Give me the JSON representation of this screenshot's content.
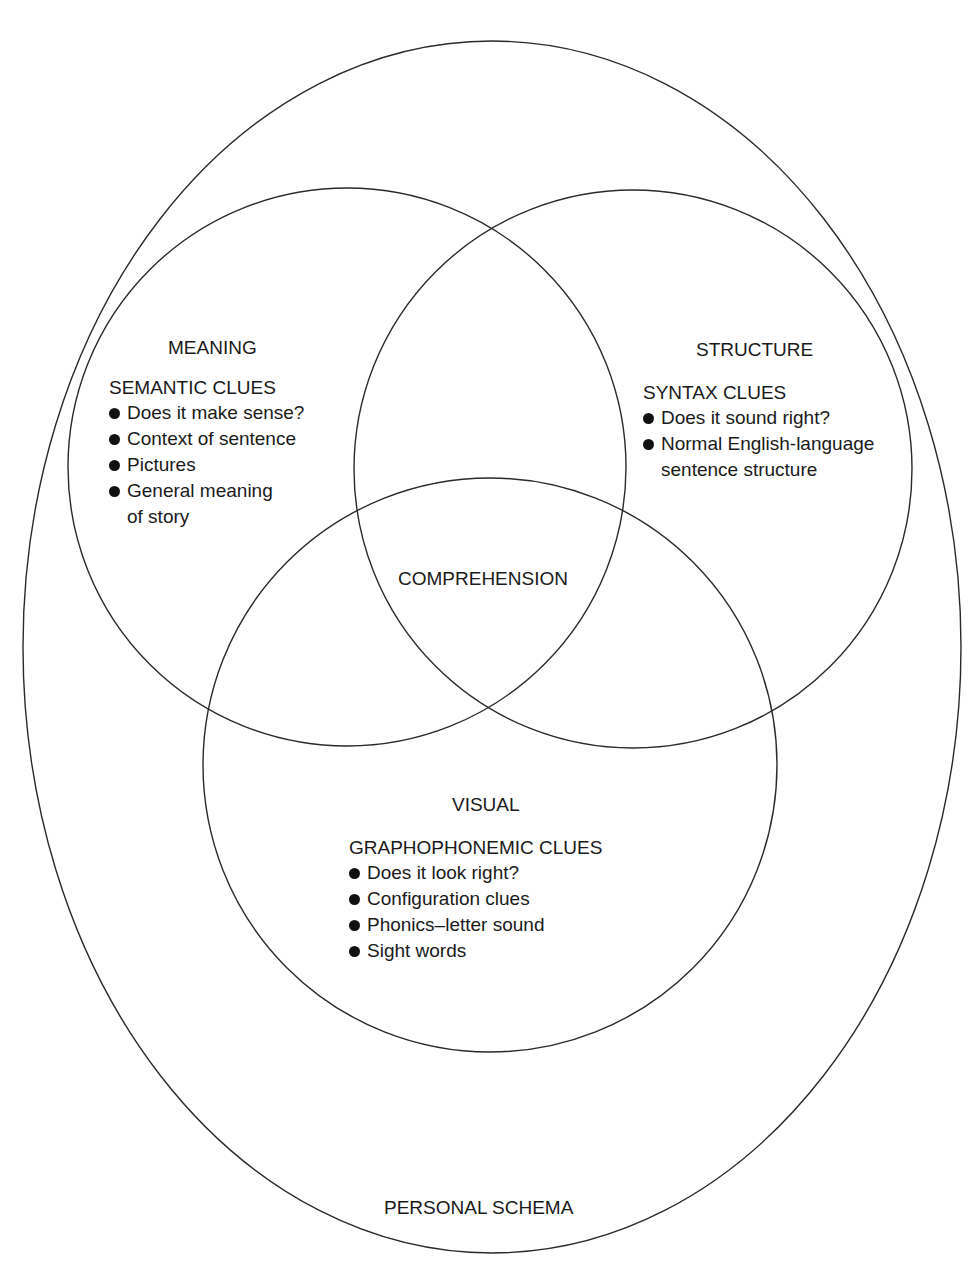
{
  "diagram": {
    "type": "venn",
    "outer": {
      "label": "PERSONAL SCHEMA"
    },
    "center": {
      "label": "COMPREHENSION"
    },
    "meaning": {
      "title": "MEANING",
      "subtitle": "SEMANTIC CLUES",
      "items": [
        "Does it make sense?",
        "Context of sentence",
        "Pictures",
        "General meaning",
        "of story"
      ]
    },
    "structure": {
      "title": "STRUCTURE",
      "subtitle": "SYNTAX CLUES",
      "items": [
        "Does it sound right?",
        "Normal English-language",
        "sentence structure"
      ]
    },
    "visual": {
      "title": "VISUAL",
      "subtitle": "GRAPHOPHONEMIC CLUES",
      "items": [
        "Does it look right?",
        "Configuration clues",
        "Phonics–letter sound",
        "Sight words"
      ]
    }
  },
  "colors": {
    "stroke": "#2a2a2a",
    "text": "#1a1a1a",
    "background": "#ffffff"
  }
}
